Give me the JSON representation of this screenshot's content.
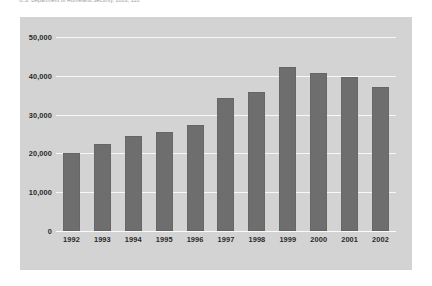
{
  "source_note": "U.S. Department of Homeland Security, 2003, 110",
  "colors": {
    "bar": "#6e6e6e",
    "panel_background": "#d3d3d3",
    "gridline": "#f7f7f7",
    "page_background": "#ffffff",
    "tick_text": "#2a2a2a"
  },
  "chart_data": {
    "type": "bar",
    "title": "",
    "xlabel": "",
    "ylabel": "",
    "categories": [
      "1992",
      "1993",
      "1994",
      "1995",
      "1996",
      "1997",
      "1998",
      "1999",
      "2000",
      "2001",
      "2002"
    ],
    "values": [
      20200,
      22500,
      24600,
      25500,
      27300,
      34300,
      35800,
      42300,
      40700,
      39700,
      37200
    ],
    "ylim": [
      0,
      50000
    ],
    "yticks": [
      0,
      10000,
      20000,
      30000,
      40000,
      50000
    ],
    "ytick_labels": [
      "0",
      "10,000",
      "20,000",
      "30,000",
      "40,000",
      "50,000"
    ],
    "grid": true,
    "legend": false,
    "orientation": "vertical",
    "series": [
      {
        "name": "",
        "values": [
          20200,
          22500,
          24600,
          25500,
          27300,
          34300,
          35800,
          42300,
          40700,
          39700,
          37200
        ]
      }
    ]
  }
}
